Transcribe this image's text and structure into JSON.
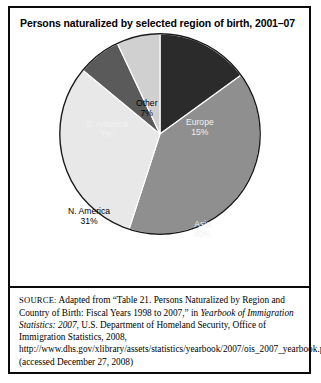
{
  "figure": {
    "title": "Persons naturalized by selected region of birth, 2001–07"
  },
  "source_note": {
    "kicker": "SOURCE:",
    "text_before_italic1": " Adapted from “Table 21. Persons Naturalized by Region and Country of Birth: Fiscal Years 1998 to 2007,” in ",
    "italic1": "Yearbook of Immigration Statistics: 2007",
    "text_after_italic1": ", U.S. Department of Homeland Security, Office of Immigration Statistics, 2008, http://www.dhs.gov/xlibrary/assets/statistics/yearbook/2007/ois_2007_yearbook.pdf (accessed December 27, 2008)"
  },
  "chart_data": {
    "type": "pie",
    "title": "Persons naturalized by selected region of birth, 2001–07",
    "xlabel": "",
    "ylabel": "",
    "units": "percent",
    "legend": "none (slices labeled in place)",
    "start_angle_deg": 0,
    "direction": "clockwise",
    "categories": [
      "Europe",
      "Asia",
      "N. America",
      "S. America",
      "Other"
    ],
    "values": [
      15,
      40,
      31,
      7,
      7
    ],
    "slices": [
      {
        "label": "Europe",
        "value": 15,
        "value_text": "15%",
        "color": "#2b2b2b",
        "text_color": "#f2f2f2"
      },
      {
        "label": "Asia",
        "value": 40,
        "value_text": "40%",
        "color": "#8f8f8f",
        "text_color": "#f2f2f2"
      },
      {
        "label": "N. America",
        "value": 31,
        "value_text": "31%",
        "color": "#e8e8e8",
        "text_color": "#000000"
      },
      {
        "label": "S. America",
        "value": 7,
        "value_text": "7%",
        "color": "#5a5a5a",
        "text_color": "#f2f2f2"
      },
      {
        "label": "Other",
        "value": 7,
        "value_text": "7%",
        "color": "#d0d0d0",
        "text_color": "#000000"
      }
    ]
  }
}
